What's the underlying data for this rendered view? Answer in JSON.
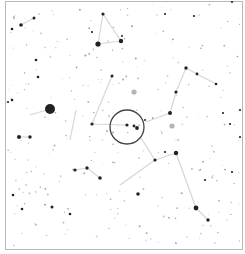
{
  "chart_data": {
    "type": "star-chart",
    "title": "",
    "frame": {
      "x": 5,
      "y": 1,
      "w": 238,
      "h": 249,
      "color": "#b8b8b8"
    },
    "field_circle": {
      "cx": 127,
      "cy": 127,
      "r": 17,
      "color": "#444444"
    },
    "line_color": "#d6d6d6",
    "star_color": "#222222",
    "gray_star_color": "#b5b5b5",
    "bright_stars": [
      {
        "x": 50,
        "y": 109,
        "r": 5
      },
      {
        "x": 98,
        "y": 44,
        "r": 2.6
      },
      {
        "x": 121,
        "y": 41,
        "r": 2.2
      },
      {
        "x": 103,
        "y": 14,
        "r": 1.6
      },
      {
        "x": 21,
        "y": 25,
        "r": 1.8
      },
      {
        "x": 34,
        "y": 18,
        "r": 1.5
      },
      {
        "x": 12,
        "y": 29,
        "r": 1.3
      },
      {
        "x": 92,
        "y": 124,
        "r": 1.6
      },
      {
        "x": 127,
        "y": 125,
        "r": 1.6
      },
      {
        "x": 134,
        "y": 126,
        "r": 1.4
      },
      {
        "x": 137,
        "y": 128,
        "r": 1.9
      },
      {
        "x": 186,
        "y": 68,
        "r": 1.7
      },
      {
        "x": 197,
        "y": 74,
        "r": 1.4
      },
      {
        "x": 216,
        "y": 84,
        "r": 1.3
      },
      {
        "x": 176,
        "y": 92,
        "r": 1.6
      },
      {
        "x": 170,
        "y": 113,
        "r": 2.0
      },
      {
        "x": 176,
        "y": 153,
        "r": 2.2
      },
      {
        "x": 155,
        "y": 160,
        "r": 1.6
      },
      {
        "x": 196,
        "y": 208,
        "r": 2.4
      },
      {
        "x": 208,
        "y": 220,
        "r": 1.7
      },
      {
        "x": 19,
        "y": 137,
        "r": 2.0
      },
      {
        "x": 30,
        "y": 137,
        "r": 1.7
      },
      {
        "x": 75,
        "y": 170,
        "r": 1.6
      },
      {
        "x": 87,
        "y": 168,
        "r": 1.7
      },
      {
        "x": 100,
        "y": 178,
        "r": 1.8
      },
      {
        "x": 138,
        "y": 194,
        "r": 1.8
      },
      {
        "x": 112,
        "y": 76,
        "r": 1.5
      },
      {
        "x": 36,
        "y": 60,
        "r": 1.3
      },
      {
        "x": 38,
        "y": 77,
        "r": 1.3
      },
      {
        "x": 12,
        "y": 100,
        "r": 1.3
      },
      {
        "x": 8,
        "y": 102,
        "r": 1.1
      },
      {
        "x": 13,
        "y": 195,
        "r": 1.3
      },
      {
        "x": 22,
        "y": 209,
        "r": 1.3
      },
      {
        "x": 52,
        "y": 207,
        "r": 1.5
      },
      {
        "x": 70,
        "y": 214,
        "r": 1.3
      },
      {
        "x": 92,
        "y": 32,
        "r": 1.1
      },
      {
        "x": 165,
        "y": 14,
        "r": 1.1
      },
      {
        "x": 194,
        "y": 16,
        "r": 1.1
      },
      {
        "x": 232,
        "y": 2,
        "r": 1.1
      },
      {
        "x": 240,
        "y": 110,
        "r": 1.1
      },
      {
        "x": 240,
        "y": 137,
        "r": 1.1
      },
      {
        "x": 223,
        "y": 113,
        "r": 1.1
      },
      {
        "x": 232,
        "y": 172,
        "r": 1.1
      },
      {
        "x": 230,
        "y": 124,
        "r": 1.1
      },
      {
        "x": 205,
        "y": 180,
        "r": 1.1
      },
      {
        "x": 165,
        "y": 152,
        "r": 1.1
      },
      {
        "x": 145,
        "y": 120,
        "r": 1.0
      },
      {
        "x": 122,
        "y": 36,
        "r": 1.0
      }
    ],
    "gray_stars": [
      {
        "x": 134,
        "y": 92,
        "r": 2.6
      },
      {
        "x": 172,
        "y": 126,
        "r": 2.6
      }
    ],
    "lines": [
      [
        [
          21,
          25
        ],
        [
          34,
          18
        ]
      ],
      [
        [
          98,
          44
        ],
        [
          121,
          41
        ]
      ],
      [
        [
          121,
          41
        ],
        [
          103,
          14
        ]
      ],
      [
        [
          103,
          14
        ],
        [
          98,
          44
        ]
      ],
      [
        [
          50,
          109
        ],
        [
          30,
          115
        ]
      ],
      [
        [
          92,
          124
        ],
        [
          127,
          125
        ]
      ],
      [
        [
          92,
          124
        ],
        [
          112,
          76
        ]
      ],
      [
        [
          186,
          68
        ],
        [
          197,
          74
        ]
      ],
      [
        [
          197,
          74
        ],
        [
          216,
          84
        ]
      ],
      [
        [
          186,
          68
        ],
        [
          176,
          92
        ]
      ],
      [
        [
          176,
          92
        ],
        [
          170,
          113
        ]
      ],
      [
        [
          170,
          113
        ],
        [
          146,
          122
        ]
      ],
      [
        [
          141,
          138
        ],
        [
          155,
          160
        ]
      ],
      [
        [
          155,
          160
        ],
        [
          176,
          153
        ]
      ],
      [
        [
          176,
          153
        ],
        [
          196,
          208
        ]
      ],
      [
        [
          196,
          208
        ],
        [
          208,
          220
        ]
      ],
      [
        [
          155,
          160
        ],
        [
          120,
          185
        ]
      ],
      [
        [
          19,
          137
        ],
        [
          30,
          137
        ]
      ],
      [
        [
          75,
          170
        ],
        [
          87,
          168
        ]
      ],
      [
        [
          87,
          168
        ],
        [
          100,
          178
        ]
      ],
      [
        [
          76,
          110
        ],
        [
          70,
          140
        ]
      ]
    ],
    "faint_star_seed": 73,
    "faint_star_count": 260
  }
}
